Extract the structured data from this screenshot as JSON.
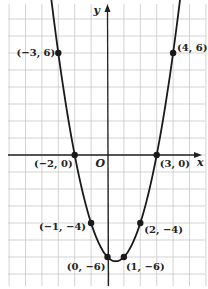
{
  "chart_data": {
    "type": "line",
    "title": "",
    "function": "y = x^2 - x - 6",
    "xlabel": "x",
    "ylabel": "y",
    "origin_label": "O",
    "xlim": [
      -6,
      6
    ],
    "ylim": [
      -8,
      9
    ],
    "grid": true,
    "colors": {
      "grid": "#c8c8c8",
      "axis": "#222222",
      "curve": "#1a1a1a",
      "point": "#1a1a1a"
    },
    "series": [
      {
        "name": "parabola",
        "points": [
          {
            "x": -3,
            "y": 6,
            "label": "(−3, 6)"
          },
          {
            "x": -2,
            "y": 0,
            "label": "(−2, 0)"
          },
          {
            "x": -1,
            "y": -4,
            "label": "(−1, −4)"
          },
          {
            "x": 0,
            "y": -6,
            "label": "(0, −6)"
          },
          {
            "x": 1,
            "y": -6,
            "label": "(1, −6)"
          },
          {
            "x": 2,
            "y": -4,
            "label": "(2, −4)"
          },
          {
            "x": 3,
            "y": 0,
            "label": "(3, 0)"
          },
          {
            "x": 4,
            "y": 6,
            "label": "(4, 6)"
          }
        ]
      }
    ]
  }
}
